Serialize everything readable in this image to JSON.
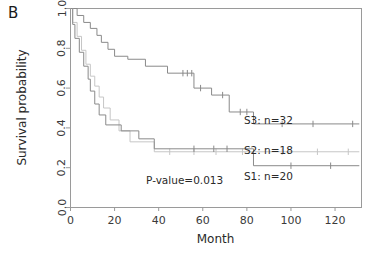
{
  "panel": {
    "label": "B"
  },
  "chart_data": {
    "type": "line",
    "subtype": "kaplan-meier-survival",
    "title": "",
    "xlabel": "Month",
    "ylabel": "Survival probability",
    "xlim": [
      0,
      132
    ],
    "ylim": [
      0,
      1.0
    ],
    "xticks": [
      0,
      20,
      40,
      60,
      80,
      100,
      120
    ],
    "xtick_labels": [
      "0",
      "20",
      "40",
      "60",
      "80",
      "100",
      "120"
    ],
    "yticks": [
      0.0,
      0.2,
      0.4,
      0.6,
      0.8,
      1.0
    ],
    "ytick_labels": [
      "0.0",
      "0.2",
      "0.4",
      "0.6",
      "0.8",
      "1.0"
    ],
    "grid": false,
    "legend_position": "inline-right-of-curves",
    "annotations": [
      {
        "name": "p-value",
        "text": "P-value=0.013",
        "x": 52,
        "y": 0.115
      },
      {
        "name": "s3-label",
        "text": "S3: n=32",
        "x": 90,
        "y": 0.415
      },
      {
        "name": "s2-label",
        "text": "S2: n=18",
        "x": 90,
        "y": 0.265
      },
      {
        "name": "s1-label",
        "text": "S1: n=20",
        "x": 90,
        "y": 0.135
      }
    ],
    "series": [
      {
        "name": "S3: n=32",
        "label": "S3",
        "n": 32,
        "color": "#8a8a8a",
        "steps": [
          [
            0,
            1.0
          ],
          [
            3,
            1.0
          ],
          [
            3,
            0.965
          ],
          [
            6,
            0.965
          ],
          [
            6,
            0.93
          ],
          [
            9,
            0.93
          ],
          [
            9,
            0.9
          ],
          [
            12,
            0.9
          ],
          [
            12,
            0.865
          ],
          [
            14,
            0.865
          ],
          [
            14,
            0.83
          ],
          [
            17,
            0.83
          ],
          [
            17,
            0.795
          ],
          [
            20,
            0.795
          ],
          [
            20,
            0.76
          ],
          [
            26,
            0.76
          ],
          [
            26,
            0.745
          ],
          [
            34,
            0.745
          ],
          [
            34,
            0.71
          ],
          [
            44,
            0.71
          ],
          [
            44,
            0.675
          ],
          [
            56,
            0.675
          ],
          [
            56,
            0.6
          ],
          [
            64,
            0.6
          ],
          [
            64,
            0.565
          ],
          [
            72,
            0.565
          ],
          [
            72,
            0.48
          ],
          [
            83,
            0.48
          ],
          [
            83,
            0.42
          ],
          [
            131,
            0.42
          ]
        ],
        "censored": [
          [
            51,
            0.675
          ],
          [
            53,
            0.675
          ],
          [
            55,
            0.675
          ],
          [
            59,
            0.6
          ],
          [
            69,
            0.565
          ],
          [
            77,
            0.48
          ],
          [
            80,
            0.48
          ],
          [
            96,
            0.42
          ],
          [
            110,
            0.42
          ],
          [
            128,
            0.42
          ]
        ]
      },
      {
        "name": "S2: n=18",
        "label": "S2",
        "n": 18,
        "color": "#c6c6c6",
        "steps": [
          [
            0,
            1.0
          ],
          [
            1,
            1.0
          ],
          [
            1,
            0.93
          ],
          [
            3,
            0.93
          ],
          [
            3,
            0.86
          ],
          [
            5,
            0.86
          ],
          [
            5,
            0.79
          ],
          [
            7,
            0.79
          ],
          [
            7,
            0.72
          ],
          [
            9,
            0.72
          ],
          [
            9,
            0.66
          ],
          [
            11,
            0.66
          ],
          [
            11,
            0.61
          ],
          [
            13,
            0.61
          ],
          [
            13,
            0.555
          ],
          [
            15,
            0.555
          ],
          [
            15,
            0.5
          ],
          [
            18,
            0.5
          ],
          [
            18,
            0.44
          ],
          [
            22,
            0.44
          ],
          [
            22,
            0.385
          ],
          [
            27,
            0.385
          ],
          [
            27,
            0.33
          ],
          [
            38,
            0.33
          ],
          [
            38,
            0.28
          ],
          [
            131,
            0.28
          ]
        ],
        "censored": [
          [
            45,
            0.28
          ],
          [
            56,
            0.28
          ],
          [
            66,
            0.28
          ],
          [
            78,
            0.28
          ],
          [
            96,
            0.28
          ],
          [
            112,
            0.28
          ],
          [
            126,
            0.28
          ]
        ]
      },
      {
        "name": "S1: n=20",
        "label": "S1",
        "n": 20,
        "color": "#8a8a8a",
        "steps": [
          [
            0,
            1.0
          ],
          [
            1,
            1.0
          ],
          [
            1,
            0.92
          ],
          [
            2,
            0.92
          ],
          [
            2,
            0.85
          ],
          [
            4,
            0.85
          ],
          [
            4,
            0.78
          ],
          [
            6,
            0.78
          ],
          [
            6,
            0.71
          ],
          [
            8,
            0.71
          ],
          [
            8,
            0.645
          ],
          [
            9,
            0.645
          ],
          [
            9,
            0.585
          ],
          [
            11,
            0.585
          ],
          [
            11,
            0.52
          ],
          [
            13,
            0.52
          ],
          [
            13,
            0.465
          ],
          [
            16,
            0.465
          ],
          [
            16,
            0.415
          ],
          [
            23,
            0.415
          ],
          [
            23,
            0.385
          ],
          [
            31,
            0.385
          ],
          [
            31,
            0.345
          ],
          [
            38,
            0.345
          ],
          [
            38,
            0.295
          ],
          [
            83,
            0.295
          ],
          [
            83,
            0.21
          ],
          [
            131,
            0.21
          ]
        ],
        "censored": [
          [
            56,
            0.295
          ],
          [
            65,
            0.295
          ],
          [
            71,
            0.295
          ],
          [
            100,
            0.21
          ],
          [
            118,
            0.21
          ]
        ]
      }
    ]
  }
}
